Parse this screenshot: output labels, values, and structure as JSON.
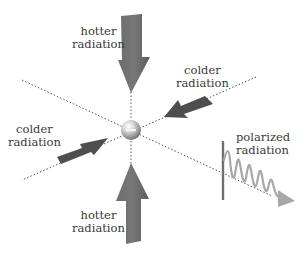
{
  "diagram": {
    "center": {
      "x": 131,
      "y": 130,
      "radius": 10,
      "symbol": "minus",
      "meaning": "electron"
    },
    "colors": {
      "arrow": "#6a6a6a",
      "arrow_dark": "#4e4e4e",
      "dotted_line": "#555555",
      "wave": "#a8a8a8",
      "polarizer": "#707070",
      "text": "#3a3a3a"
    },
    "labels": {
      "hotter_top": {
        "line1": "hotter",
        "line2": "radiation"
      },
      "colder_right": {
        "line1": "colder",
        "line2": "radiation"
      },
      "colder_left": {
        "line1": "colder",
        "line2": "radiation"
      },
      "hotter_bottom": {
        "line1": "hotter",
        "line2": "radiation"
      },
      "polarized": {
        "line1": "polarized",
        "line2": "radiation"
      }
    },
    "arrows": [
      {
        "id": "hotter-top",
        "direction": "down",
        "from": [
          131,
          14
        ],
        "to": [
          131,
          93
        ],
        "width": "thick"
      },
      {
        "id": "hotter-bottom",
        "direction": "up",
        "from": [
          131,
          243
        ],
        "to": [
          131,
          163
        ],
        "width": "thick"
      },
      {
        "id": "colder-right",
        "direction": "down-left",
        "from": [
          213,
          98
        ],
        "to": [
          163,
          117
        ],
        "width": "thin"
      },
      {
        "id": "colder-left",
        "direction": "up-right",
        "from": [
          54,
          161
        ],
        "to": [
          107,
          140
        ],
        "width": "thin"
      }
    ],
    "dotted_lines": [
      {
        "from": [
          131,
          93
        ],
        "to": [
          131,
          165
        ]
      },
      {
        "from": [
          22,
          80
        ],
        "to": [
          272,
          195
        ]
      },
      {
        "from": [
          255,
          78
        ],
        "to": [
          22,
          180
        ]
      }
    ],
    "polarizer": {
      "x": 223,
      "y1": 141,
      "y2": 200
    },
    "wave": {
      "x_start": 224,
      "x_end": 285,
      "cycles": 5
    }
  }
}
